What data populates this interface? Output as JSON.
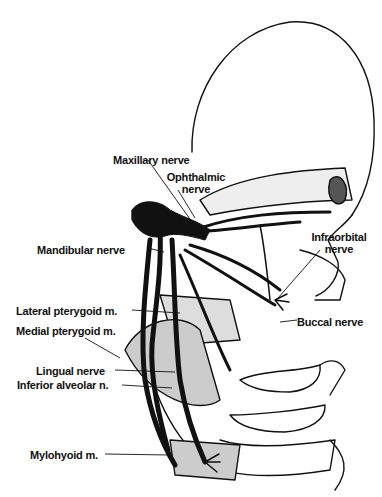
{
  "figure": {
    "labels": {
      "maxillary": "Maxillary nerve",
      "ophthalmic_1": "Ophthalmic",
      "ophthalmic_2": "nerve",
      "infraorbital_1": "Infraorbital",
      "infraorbital_2": "nerve",
      "mandibular": "Mandibular nerve",
      "lateral_pterygoid": "Lateral pterygoid m.",
      "buccal": "Buccal nerve",
      "medial_pterygoid": "Medial pterygoid m.",
      "lingual": "Lingual nerve",
      "inferior_alveolar": "Inferior alveolar n.",
      "mylohyoid": "Mylohyoid m."
    },
    "colors": {
      "ink": "#111111",
      "background": "#ffffff"
    }
  }
}
